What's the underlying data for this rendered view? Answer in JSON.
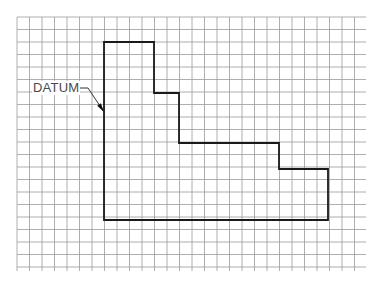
{
  "diagram": {
    "type": "grid-layout-drawing",
    "grid": {
      "x0": 17,
      "y0": 17,
      "x1": 366,
      "y1": 271,
      "spacing": 12.5,
      "color": "#9a9a9a"
    },
    "shape": {
      "stroke": "#1a1a1a",
      "points": [
        [
          104,
          42
        ],
        [
          154,
          42
        ],
        [
          154,
          93
        ],
        [
          179,
          93
        ],
        [
          179,
          143
        ],
        [
          279,
          143
        ],
        [
          279,
          169
        ],
        [
          328,
          169
        ],
        [
          328,
          220
        ],
        [
          104,
          220
        ]
      ]
    },
    "annotation": {
      "label": "DATUM",
      "leader": [
        [
          77,
          88
        ],
        [
          88,
          88
        ],
        [
          104,
          112
        ]
      ]
    }
  }
}
